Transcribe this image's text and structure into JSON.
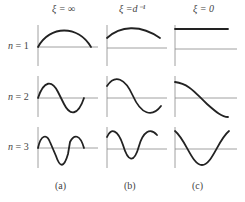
{
  "columns": [
    {
      "id": "a",
      "header": "ξ = ∞",
      "label": "(a)"
    },
    {
      "id": "b",
      "header": "ξ =d⁻¹",
      "label": "(b)"
    },
    {
      "id": "c",
      "header": "ξ = 0",
      "label": "(c)"
    }
  ],
  "rows": [
    {
      "n_symbol": "n",
      "eq": " = 1"
    },
    {
      "n_symbol": "n",
      "eq": " = 2"
    },
    {
      "n_symbol": "n",
      "eq": " = 3"
    }
  ],
  "colors": {
    "curve": "#222222",
    "axis": "#888888"
  }
}
